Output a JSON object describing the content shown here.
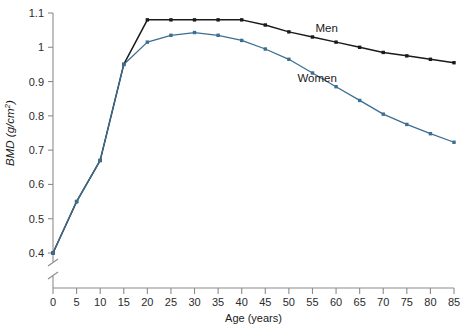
{
  "chart_data": {
    "type": "line",
    "title": "",
    "xlabel": "Age (years)",
    "ylabel": "BMD (g/cm²)",
    "xlim": [
      0,
      85
    ],
    "ylim": [
      0.4,
      1.1
    ],
    "xticks": [
      0,
      5,
      10,
      15,
      20,
      25,
      30,
      35,
      40,
      45,
      50,
      55,
      60,
      65,
      70,
      75,
      80,
      85
    ],
    "xtick_labels": [
      "0",
      "5",
      "10",
      "15",
      "20",
      "25",
      "30",
      "35",
      "40",
      "45",
      "50",
      "55",
      "60",
      "65",
      "70",
      "75",
      "80",
      "85"
    ],
    "yticks": [
      0.4,
      0.5,
      0.6,
      0.7,
      0.8,
      0.9,
      1.0,
      1.1
    ],
    "ytick_labels": [
      "0.4",
      "0.5",
      "0.6",
      "0.7",
      "0.8",
      "0.9",
      "1",
      "1.1"
    ],
    "grid": false,
    "legend_position": "inline-annotations",
    "y_axis_break": true,
    "y_axis_break_note": "axis broken below 0.4",
    "x": [
      0,
      5,
      10,
      15,
      20,
      25,
      30,
      35,
      40,
      45,
      50,
      55,
      60,
      65,
      70,
      75,
      80,
      85
    ],
    "series": [
      {
        "name": "Men",
        "color": "#1a1a1a",
        "marker": "square",
        "values": [
          0.4,
          0.55,
          0.67,
          0.95,
          1.08,
          1.08,
          1.08,
          1.08,
          1.08,
          1.065,
          1.045,
          1.03,
          1.015,
          1.0,
          0.985,
          0.975,
          0.965,
          0.955
        ]
      },
      {
        "name": "Women",
        "color": "#3c6e92",
        "marker": "square",
        "values": [
          0.4,
          0.55,
          0.67,
          0.95,
          1.015,
          1.035,
          1.043,
          1.035,
          1.02,
          0.995,
          0.965,
          0.925,
          0.885,
          0.845,
          0.805,
          0.775,
          0.748,
          0.723
        ]
      }
    ],
    "annotations": [
      {
        "text": "Men",
        "x": 58,
        "y": 1.045
      },
      {
        "text": "Women",
        "x": 56,
        "y": 0.9
      }
    ]
  }
}
